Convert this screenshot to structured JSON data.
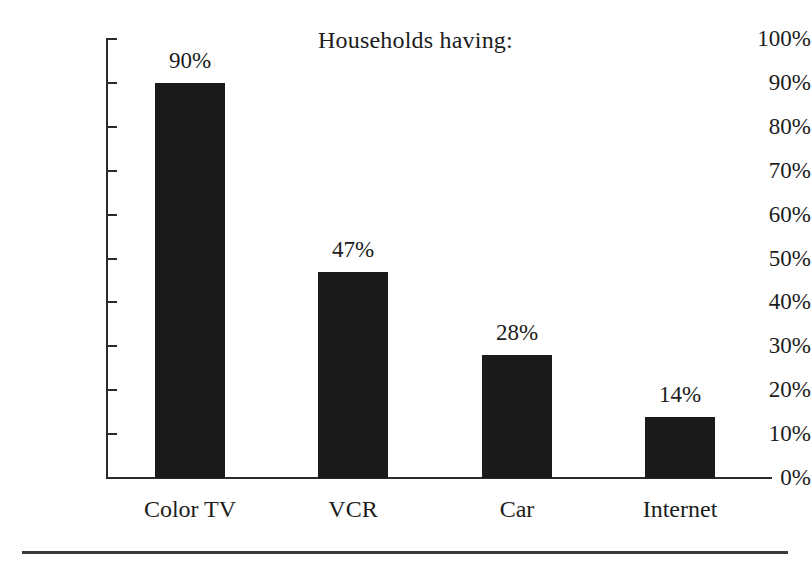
{
  "chart_data": {
    "type": "bar",
    "title": "Households having:",
    "xlabel": "",
    "ylabel": "",
    "categories": [
      "Color TV",
      "VCR",
      "Car",
      "Internet"
    ],
    "values": [
      90,
      47,
      28,
      14
    ],
    "value_labels": [
      "90%",
      "47%",
      "28%",
      "14%"
    ],
    "ylim": [
      0,
      100
    ],
    "ytick_values": [
      0,
      10,
      20,
      30,
      40,
      50,
      60,
      70,
      80,
      90,
      100
    ],
    "ytick_labels": [
      "0%",
      "10%",
      "20%",
      "30%",
      "40%",
      "50%",
      "60%",
      "70%",
      "80%",
      "90%",
      "100%"
    ],
    "grid": false,
    "legend": false,
    "legend_position": "none",
    "bar_color": "#1a1a1a",
    "axis_color": "#2b2b2b",
    "text_color": "#1c1c1c",
    "background_color": "#ffffff"
  },
  "figure": {
    "footer_rule_present": true
  }
}
